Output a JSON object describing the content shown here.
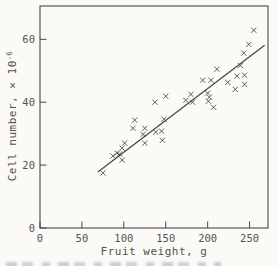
{
  "palette": {
    "paper": "#fbfaf7",
    "ink": "#474747",
    "text": "#525252"
  },
  "chart_data": {
    "type": "scatter",
    "title": "",
    "xlabel": "Fruit weight, g",
    "ylabel_base": "Cell number, × 10",
    "ylabel_exp": "-6",
    "xlim": [
      0,
      272
    ],
    "ylim": [
      0,
      70.6
    ],
    "xticks": [
      0,
      50,
      100,
      150,
      200,
      250
    ],
    "yticks": [
      0,
      20,
      40,
      60
    ],
    "grid": false,
    "legend": "none",
    "marker": "x",
    "points": [
      [
        75,
        17.5
      ],
      [
        87,
        22.9
      ],
      [
        92,
        23.8
      ],
      [
        95,
        23.5
      ],
      [
        98,
        25.4
      ],
      [
        98,
        21.6
      ],
      [
        101,
        27.0
      ],
      [
        111,
        31.7
      ],
      [
        113,
        34.3
      ],
      [
        123,
        29.8
      ],
      [
        125,
        31.7
      ],
      [
        125,
        27.0
      ],
      [
        138,
        30.5
      ],
      [
        145,
        30.8
      ],
      [
        146,
        27.9
      ],
      [
        148,
        34.6
      ],
      [
        137,
        40.0
      ],
      [
        150,
        41.9
      ],
      [
        174,
        40.6
      ],
      [
        180,
        42.5
      ],
      [
        182,
        40.0
      ],
      [
        194,
        47.0
      ],
      [
        204,
        47.0
      ],
      [
        211,
        50.5
      ],
      [
        224,
        46.3
      ],
      [
        200,
        42.9
      ],
      [
        202,
        41.6
      ],
      [
        201,
        40.3
      ],
      [
        207,
        38.4
      ],
      [
        235,
        48.3
      ],
      [
        244,
        48.6
      ],
      [
        244,
        45.7
      ],
      [
        233,
        44.1
      ],
      [
        239,
        51.7
      ],
      [
        243,
        55.6
      ],
      [
        249,
        58.4
      ],
      [
        255,
        62.9
      ]
    ],
    "fit_line": {
      "x1": 69,
      "y1": 17.8,
      "x2": 268,
      "y2": 58.1
    }
  }
}
